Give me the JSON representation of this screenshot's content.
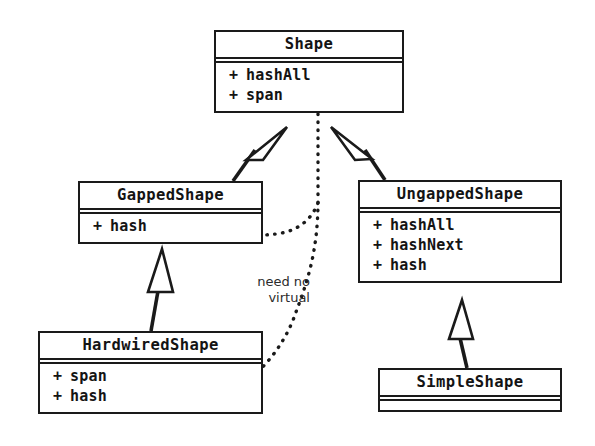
{
  "diagram": {
    "kind": "uml-class-diagram",
    "background": "#ffffff",
    "line_color": "#1a1a1a",
    "text_color": "#141414",
    "classes": [
      {
        "id": "shape",
        "name": "Shape",
        "members": [
          {
            "visibility": "+",
            "name": "hashAll"
          },
          {
            "visibility": "+",
            "name": "span"
          }
        ]
      },
      {
        "id": "gapped_shape",
        "name": "GappedShape",
        "members": [
          {
            "visibility": "+",
            "name": "hash"
          }
        ]
      },
      {
        "id": "ungapped_shape",
        "name": "UngappedShape",
        "members": [
          {
            "visibility": "+",
            "name": "hashAll"
          },
          {
            "visibility": "+",
            "name": "hashNext"
          },
          {
            "visibility": "+",
            "name": "hash"
          }
        ]
      },
      {
        "id": "hardwired_shape",
        "name": "HardwiredShape",
        "members": [
          {
            "visibility": "+",
            "name": "span"
          },
          {
            "visibility": "+",
            "name": "hash"
          }
        ]
      },
      {
        "id": "simple_shape",
        "name": "SimpleShape",
        "members": []
      }
    ],
    "annotations": [
      {
        "id": "need-no-virtual",
        "line1": "need no",
        "line2": "virtual"
      }
    ],
    "relationships": [
      {
        "type": "generalization",
        "from": "GappedShape",
        "to": "Shape"
      },
      {
        "type": "generalization",
        "from": "UngappedShape",
        "to": "Shape"
      },
      {
        "type": "generalization",
        "from": "HardwiredShape",
        "to": "GappedShape"
      },
      {
        "type": "generalization",
        "from": "SimpleShape",
        "to": "UngappedShape"
      },
      {
        "type": "dependency",
        "from": "Shape",
        "to": "GappedShape.hash"
      },
      {
        "type": "dependency",
        "from": "Shape",
        "to": "HardwiredShape.hash"
      }
    ]
  }
}
